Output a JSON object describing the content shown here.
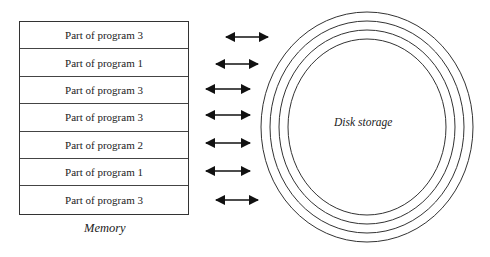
{
  "memory": {
    "label": "Memory",
    "rows": [
      {
        "label": "Part of program 3"
      },
      {
        "label": "Part of program 1"
      },
      {
        "label": "Part of program 3"
      },
      {
        "label": "Part of program 3"
      },
      {
        "label": "Part of program 2"
      },
      {
        "label": "Part of program 1"
      },
      {
        "label": "Part of program 3"
      }
    ]
  },
  "arrows": [
    {
      "x1": 226,
      "x2": 268,
      "y": 37
    },
    {
      "x1": 216,
      "x2": 258,
      "y": 64
    },
    {
      "x1": 206,
      "x2": 250,
      "y": 89
    },
    {
      "x1": 206,
      "x2": 250,
      "y": 115
    },
    {
      "x1": 206,
      "x2": 250,
      "y": 143
    },
    {
      "x1": 206,
      "x2": 250,
      "y": 171
    },
    {
      "x1": 216,
      "x2": 258,
      "y": 200
    }
  ],
  "disk": {
    "label": "Disk storage",
    "rings": 4
  }
}
